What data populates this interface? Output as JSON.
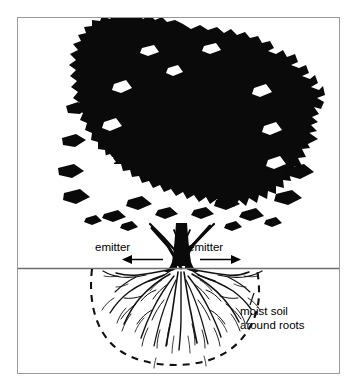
{
  "page": {
    "header_fragment": "",
    "background_color": "#ffffff"
  },
  "figure": {
    "frame_border_color": "#9a9a9a",
    "ink_color": "#000000",
    "ground_line_color": "#6d6d6d",
    "labels": {
      "emitter_left": "emitter",
      "emitter_right": "emitter",
      "moist_soil_line1": "moist soil",
      "moist_soil_line2": "around roots"
    },
    "elements": {
      "tree_canopy": "tree-canopy-silhouette",
      "tree_trunk": "tree-trunk-silhouette",
      "ground_line": "ground-surface-line",
      "root_system": "root-system-drawing",
      "wetted_zone": "dashed-moist-soil-ellipse",
      "arrow_left": "emitter-arrow-left",
      "arrow_right": "emitter-arrow-right"
    }
  }
}
